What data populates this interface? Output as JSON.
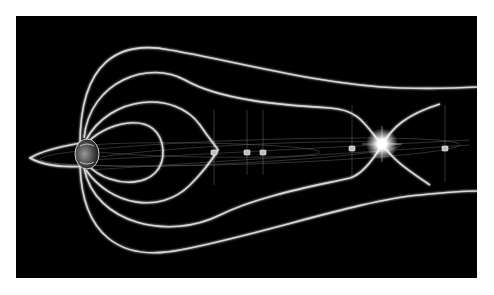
{
  "figure": {
    "background_color": "#000000",
    "line_color": "#d8d8d8",
    "flash_color": "#ffffff"
  },
  "elements": {
    "planet": {
      "label": ""
    },
    "spacecraft_count": 6,
    "reconnection_site": {
      "label": ""
    }
  }
}
